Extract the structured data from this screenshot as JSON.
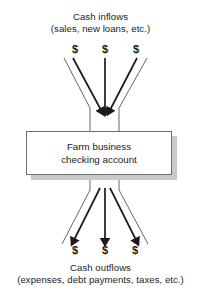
{
  "diagram": {
    "background_color": "#ffffff",
    "inflow": {
      "caption_line1": "Cash inflows",
      "caption_line2": "(sales, new loans, etc.)",
      "money_symbol": "$",
      "money_symbols": [
        "$",
        "$",
        "$"
      ],
      "symbol_positions_x": [
        75,
        105,
        136
      ],
      "arrow_count": 3,
      "funnel_line_count": 2,
      "direction": "down"
    },
    "account_box": {
      "line1": "Farm business",
      "line2": "checking account",
      "border_color": "#6d6d6d",
      "fill_color": "#ffffff",
      "shadow_color": "#c9c9c9"
    },
    "outflow": {
      "caption_line1": "Cash outflows",
      "caption_line2": "(expenses, debt payments, taxes, etc.)",
      "money_symbol": "$",
      "money_symbols": [
        "$",
        "$",
        "$"
      ],
      "symbol_positions_x": [
        75,
        105,
        135
      ],
      "arrow_count": 3,
      "funnel_line_count": 2,
      "direction": "down"
    },
    "arrow_color": "#1a1a1a",
    "funnel_line_color": "#555555"
  }
}
